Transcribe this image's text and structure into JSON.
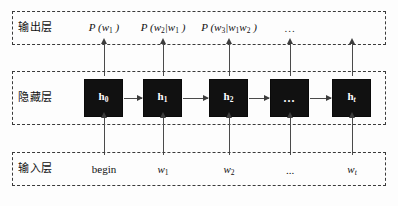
{
  "figure": {
    "type": "diagram",
    "caption_partial": ""
  },
  "colors": {
    "cell_fill": "#111111",
    "cell_text": "#ffffff",
    "frame_border": "#3a3a3a",
    "arrow": "#4a4a4a",
    "background": "#fdfdfd"
  },
  "layers": {
    "output": {
      "label": "输出层",
      "items": [
        {
          "name": "prob-w1",
          "prefix": "P",
          "open": " (",
          "base": "w",
          "sub": "1",
          "close": " )",
          "x": 104
        },
        {
          "name": "prob-w2-w1",
          "prefix": "P",
          "open": " (",
          "base": "w",
          "sub": "2",
          "cond": "|w",
          "cond_sub": "1",
          "close": " )",
          "x": 163
        },
        {
          "name": "prob-w3-w1w2",
          "prefix": "P",
          "open": " (",
          "base": "w",
          "sub": "3",
          "cond": "|w",
          "cond_sub": "1",
          "cond2": "w",
          "cond2_sub": "2",
          "close": " )",
          "x": 229
        }
      ],
      "ellipsis": "...",
      "ellipsis_x": 290
    },
    "hidden": {
      "label": "隐藏层",
      "cells": [
        {
          "name": "hidden-cell-h0",
          "base": "h",
          "sub": "0",
          "sub_italic": false,
          "x": 84
        },
        {
          "name": "hidden-cell-h1",
          "base": "h",
          "sub": "1",
          "sub_italic": false,
          "x": 143
        },
        {
          "name": "hidden-cell-h2",
          "base": "h",
          "sub": "2",
          "sub_italic": false,
          "x": 209
        },
        {
          "name": "hidden-cell-ellipsis",
          "dots": "...",
          "x": 270
        },
        {
          "name": "hidden-cell-ht",
          "base": "h",
          "sub": "t",
          "sub_italic": true,
          "x": 332
        }
      ]
    },
    "input": {
      "label": "输入层",
      "items": [
        {
          "name": "input-token-begin",
          "text": "begin",
          "italic": false,
          "x": 104
        },
        {
          "name": "input-token-w1",
          "base": "w",
          "sub": "1",
          "italic": true,
          "x": 163
        },
        {
          "name": "input-token-w2",
          "base": "w",
          "sub": "2",
          "italic": true,
          "x": 229
        },
        {
          "name": "input-token-ellipsis",
          "text": "...",
          "italic": false,
          "x": 290
        },
        {
          "name": "input-token-wt",
          "base": "w",
          "sub": "t",
          "sub_italic": true,
          "italic": true,
          "x": 352
        }
      ]
    }
  },
  "arrows": {
    "hidden_to_output_x": [
      104,
      163,
      229,
      290,
      352
    ],
    "input_to_hidden_x": [
      104,
      163,
      229,
      290,
      352
    ],
    "between_cells": [
      {
        "from": "h0",
        "to": "h1",
        "left": 124,
        "width": 18
      },
      {
        "from": "h1",
        "to": "h2",
        "left": 183,
        "width": 25
      },
      {
        "from": "h2",
        "to": "ellipsis",
        "left": 249,
        "width": 20
      },
      {
        "from": "ellipsis",
        "to": "ht",
        "left": 310,
        "width": 21
      }
    ]
  }
}
